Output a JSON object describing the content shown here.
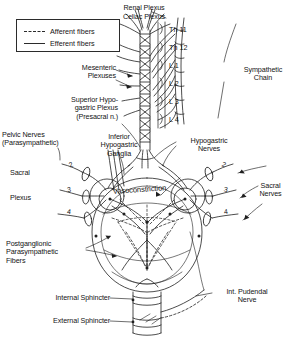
{
  "diagram": {
    "background_color": "#ffffff",
    "ink_color": "#1a1a1a"
  },
  "legend": {
    "afferent": {
      "label": "Afferent fibers",
      "style": "dashed",
      "icon": "dashed-line-icon"
    },
    "efferent": {
      "label": "Efferent fibers",
      "style": "solid",
      "icon": "solid-line-icon"
    }
  },
  "labels": {
    "renal_plexus": "Renal Plexus",
    "celiac_plexus": "Celiac Plexus",
    "mesenteric_plexuses": "Mesenteric\nPlexuses",
    "superior_hypogastric_plexus": "Superior Hypo-\ngastric Plexus\n(Presacral n.)",
    "pelvic_nerves": "Pelvic Nerves\n(Parasympathetic)",
    "sacral": "Sacral",
    "plexus": "Plexus",
    "inferior_hypogastric_ganglia": "Inferior\nHypogastric\nGanglia",
    "hypogastric_nerves": "Hypogastric\nNerves",
    "sympathetic_chain": "Sympathetic\nChain",
    "sacral_nerves": "Sacral\nNerves",
    "vasoconstriction": "Vasoconstriction",
    "postganglionic_parasympathetic_fibers": "Postganglionic\nParasympathetic\nFibers",
    "internal_sphincter": "Internal Sphincter",
    "external_sphincter": "External Sphincter",
    "internal_pudendal_nerve": "Int. Pudendal\nNerve"
  },
  "spinal_levels": [
    {
      "id": "th11",
      "label": "Th 11"
    },
    {
      "id": "th12",
      "label": "Th 12"
    },
    {
      "id": "l1",
      "label": "L 1"
    },
    {
      "id": "l2",
      "label": "L 2"
    },
    {
      "id": "l3",
      "label": "L 3"
    },
    {
      "id": "l4",
      "label": "L 4"
    }
  ],
  "sacral_roots_left": [
    {
      "id": "left-s2",
      "label": "2"
    },
    {
      "id": "left-s3",
      "label": "3"
    },
    {
      "id": "left-s4",
      "label": "4"
    }
  ],
  "sacral_roots_right": [
    {
      "id": "right-s2",
      "label": "2"
    },
    {
      "id": "right-s3",
      "label": "3"
    },
    {
      "id": "right-s4",
      "label": "4"
    }
  ]
}
